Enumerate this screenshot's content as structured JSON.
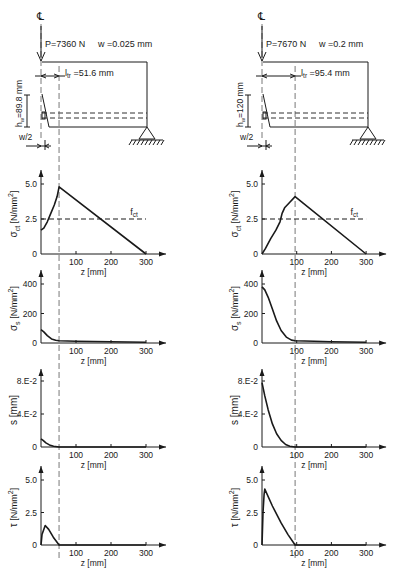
{
  "panels": [
    {
      "id": "left",
      "origin_x": 41,
      "px_per_mm": 0.35,
      "cl_symbol": "℄",
      "load_label": "P=7360 N",
      "crack_width_label": "w =0.025 mm",
      "ltr_label": "l",
      "ltr_sub": "tr",
      "ltr_value": " =51.6 mm",
      "ltr_mm": 51.6,
      "hw_label": "h",
      "hw_sub": "w",
      "hw_value": "=89.8 mm",
      "half_w_label": "w/2",
      "charts": [
        {
          "name": "sigma-ct",
          "ylabel": "σct [N/mm²]",
          "ylabel_main": "σ",
          "ylabel_sub": "ct",
          "ylabel_unit": " [N/mm",
          "ylabel_sup": "2",
          "ylabel_close": "]",
          "xlabel": "z [mm]",
          "y0": 254,
          "ytop": 170,
          "ymax_val": 5.0,
          "ymax_px": 184,
          "yticks": [
            {
              "v": 5.0,
              "label": "5.0"
            },
            {
              "v": 2.5,
              "label": "2.5"
            },
            {
              "v": 0,
              "label": "0"
            }
          ],
          "xticks": [
            100,
            200,
            300
          ],
          "fct": {
            "value": 2.5,
            "label": "f",
            "sub": "ct",
            "x_end_mm": 300
          },
          "points": [
            [
              0,
              1.7
            ],
            [
              8,
              1.85
            ],
            [
              18,
              2.3
            ],
            [
              28,
              2.9
            ],
            [
              38,
              3.5
            ],
            [
              46,
              4.1
            ],
            [
              51.6,
              4.8
            ],
            [
              300,
              0
            ]
          ]
        },
        {
          "name": "sigma-s",
          "ylabel_main": "σ",
          "ylabel_sub": "s",
          "ylabel_unit": " [N/mm",
          "ylabel_sup": "2",
          "ylabel_close": "]",
          "xlabel": "z [mm]",
          "y0": 343,
          "ytop": 270,
          "ymax_val": 400,
          "ymax_px": 284,
          "yticks": [
            {
              "v": 400,
              "label": "400"
            },
            {
              "v": 200,
              "label": "200"
            },
            {
              "v": 0,
              "label": "0"
            }
          ],
          "xticks": [
            100,
            200,
            300
          ],
          "points": [
            [
              0,
              90
            ],
            [
              8,
              75
            ],
            [
              18,
              50
            ],
            [
              30,
              28
            ],
            [
              42,
              18
            ],
            [
              51.6,
              15
            ],
            [
              100,
              12
            ],
            [
              200,
              8
            ],
            [
              300,
              5
            ]
          ]
        },
        {
          "name": "slip-s",
          "ylabel_main": "s [mm]",
          "xlabel": "z [mm]",
          "y0": 447,
          "ytop": 369,
          "ymax_val": 0.08,
          "ymax_px": 381,
          "yticks": [
            {
              "v": 0.08,
              "label": "8.E-2"
            },
            {
              "v": 0.04,
              "label": "4.E-2"
            },
            {
              "v": 0,
              "label": "0"
            }
          ],
          "xticks": [
            100,
            200,
            300
          ],
          "points": [
            [
              0,
              0.01
            ],
            [
              6,
              0.008
            ],
            [
              14,
              0.005
            ],
            [
              24,
              0.0025
            ],
            [
              36,
              0.001
            ],
            [
              51.6,
              0.0
            ],
            [
              300,
              0
            ]
          ]
        },
        {
          "name": "tau",
          "ylabel_main": "τ",
          "ylabel_unit": " [N/mm",
          "ylabel_sup": "2",
          "ylabel_close": "]",
          "xlabel": "z [mm]",
          "y0": 545,
          "ytop": 466,
          "ymax_val": 5.0,
          "ymax_px": 480,
          "yticks": [
            {
              "v": 5.0,
              "label": "5.0"
            },
            {
              "v": 2.5,
              "label": "2.5"
            },
            {
              "v": 0,
              "label": "0"
            }
          ],
          "xticks": [
            100,
            200,
            300
          ],
          "points": [
            [
              0,
              0
            ],
            [
              3,
              0.8
            ],
            [
              12,
              1.5
            ],
            [
              22,
              1.2
            ],
            [
              35,
              0.6
            ],
            [
              51.6,
              0
            ],
            [
              300,
              0
            ]
          ]
        }
      ]
    },
    {
      "id": "right",
      "origin_x": 262,
      "px_per_mm": 0.347,
      "cl_symbol": "℄",
      "load_label": "P=7670 N",
      "crack_width_label": "w =0.2 mm",
      "ltr_label": "l",
      "ltr_sub": "tr",
      "ltr_value": " =95.4 mm",
      "ltr_mm": 95.4,
      "hw_label": "h",
      "hw_sub": "w",
      "hw_value": "=120 mm",
      "half_w_label": "w/2",
      "charts": [
        {
          "name": "sigma-ct",
          "ylabel_main": "σ",
          "ylabel_sub": "ct",
          "ylabel_unit": " [N/mm",
          "ylabel_sup": "2",
          "ylabel_close": "]",
          "xlabel": "z [mm]",
          "y0": 254,
          "ytop": 170,
          "ymax_val": 5.0,
          "ymax_px": 184,
          "yticks": [
            {
              "v": 5.0,
              "label": "5.0"
            },
            {
              "v": 2.5,
              "label": "2.5"
            },
            {
              "v": 0,
              "label": "0"
            }
          ],
          "xticks": [
            100,
            200,
            300
          ],
          "fct": {
            "value": 2.5,
            "label": "f",
            "sub": "ct",
            "x_end_mm": 300
          },
          "points": [
            [
              0,
              0
            ],
            [
              10,
              0.4
            ],
            [
              25,
              1.1
            ],
            [
              40,
              1.7
            ],
            [
              52,
              2.3
            ],
            [
              58,
              2.9
            ],
            [
              65,
              3.3
            ],
            [
              80,
              3.7
            ],
            [
              95.4,
              4.1
            ],
            [
              300,
              0
            ]
          ]
        },
        {
          "name": "sigma-s",
          "ylabel_main": "σ",
          "ylabel_sub": "s",
          "ylabel_unit": " [N/mm",
          "ylabel_sup": "2",
          "ylabel_close": "]",
          "xlabel": "z [mm]",
          "y0": 343,
          "ytop": 270,
          "ymax_val": 400,
          "ymax_px": 284,
          "yticks": [
            {
              "v": 400,
              "label": "400"
            },
            {
              "v": 200,
              "label": "200"
            },
            {
              "v": 0,
              "label": "0"
            }
          ],
          "xticks": [
            100,
            200,
            300
          ],
          "points": [
            [
              0,
              380
            ],
            [
              8,
              360
            ],
            [
              18,
              310
            ],
            [
              30,
              230
            ],
            [
              42,
              150
            ],
            [
              55,
              85
            ],
            [
              70,
              40
            ],
            [
              85,
              20
            ],
            [
              95.4,
              15
            ],
            [
              150,
              12
            ],
            [
              200,
              9
            ],
            [
              300,
              5
            ]
          ]
        },
        {
          "name": "slip-s",
          "ylabel_main": "s [mm]",
          "xlabel": "z [mm]",
          "y0": 447,
          "ytop": 369,
          "ymax_val": 0.08,
          "ymax_px": 381,
          "yticks": [
            {
              "v": 0.08,
              "label": "8.E-2"
            },
            {
              "v": 0.04,
              "label": "4.E-2"
            },
            {
              "v": 0,
              "label": "0"
            }
          ],
          "xticks": [
            100,
            200,
            300
          ],
          "points": [
            [
              0,
              0.078
            ],
            [
              8,
              0.062
            ],
            [
              18,
              0.045
            ],
            [
              30,
              0.028
            ],
            [
              42,
              0.016
            ],
            [
              55,
              0.008
            ],
            [
              68,
              0.003
            ],
            [
              80,
              0.001
            ],
            [
              95.4,
              0
            ],
            [
              300,
              0
            ]
          ]
        },
        {
          "name": "tau",
          "ylabel_main": "τ",
          "ylabel_unit": " [N/mm",
          "ylabel_sup": "2",
          "ylabel_close": "]",
          "xlabel": "z [mm]",
          "y0": 545,
          "ytop": 466,
          "ymax_val": 5.0,
          "ymax_px": 480,
          "yticks": [
            {
              "v": 5.0,
              "label": "5.0"
            },
            {
              "v": 2.5,
              "label": "2.5"
            },
            {
              "v": 0,
              "label": "0"
            }
          ],
          "xticks": [
            100,
            200,
            300
          ],
          "points": [
            [
              0,
              0
            ],
            [
              3,
              2.5
            ],
            [
              6,
              3.9
            ],
            [
              8,
              4.3
            ],
            [
              30,
              3.0
            ],
            [
              55,
              1.7
            ],
            [
              75,
              0.8
            ],
            [
              95.4,
              0
            ],
            [
              300,
              0
            ]
          ]
        }
      ]
    }
  ],
  "chart_data": [
    {
      "type": "line",
      "title": "σct (w=0.025 mm)",
      "xlabel": "z [mm]",
      "ylabel": "σct [N/mm²]",
      "ylim": [
        0,
        5.0
      ],
      "xlim": [
        0,
        300
      ],
      "x": [
        0,
        8,
        18,
        28,
        38,
        46,
        51.6,
        300
      ],
      "values": [
        1.7,
        1.85,
        2.3,
        2.9,
        3.5,
        4.1,
        4.8,
        0
      ],
      "annotations": [
        "fct = 2.5"
      ]
    },
    {
      "type": "line",
      "title": "σs (w=0.025 mm)",
      "xlabel": "z [mm]",
      "ylabel": "σs [N/mm²]",
      "ylim": [
        0,
        400
      ],
      "xlim": [
        0,
        300
      ],
      "x": [
        0,
        18,
        51.6,
        100,
        200,
        300
      ],
      "values": [
        90,
        50,
        15,
        12,
        8,
        5
      ]
    },
    {
      "type": "line",
      "title": "s (w=0.025 mm)",
      "xlabel": "z [mm]",
      "ylabel": "s [mm]",
      "ylim": [
        0,
        0.08
      ],
      "xlim": [
        0,
        300
      ],
      "x": [
        0,
        14,
        36,
        51.6,
        300
      ],
      "values": [
        0.01,
        0.005,
        0.001,
        0,
        0
      ]
    },
    {
      "type": "line",
      "title": "τ (w=0.025 mm)",
      "xlabel": "z [mm]",
      "ylabel": "τ [N/mm²]",
      "ylim": [
        0,
        5.0
      ],
      "xlim": [
        0,
        300
      ],
      "x": [
        0,
        12,
        35,
        51.6,
        300
      ],
      "values": [
        0,
        1.5,
        0.6,
        0,
        0
      ]
    },
    {
      "type": "line",
      "title": "σct (w=0.2 mm)",
      "xlabel": "z [mm]",
      "ylabel": "σct [N/mm²]",
      "ylim": [
        0,
        5.0
      ],
      "xlim": [
        0,
        300
      ],
      "x": [
        0,
        25,
        52,
        65,
        95.4,
        300
      ],
      "values": [
        0,
        1.1,
        2.3,
        3.3,
        4.1,
        0
      ],
      "annotations": [
        "fct = 2.5"
      ]
    },
    {
      "type": "line",
      "title": "σs (w=0.2 mm)",
      "xlabel": "z [mm]",
      "ylabel": "σs [N/mm²]",
      "ylim": [
        0,
        400
      ],
      "xlim": [
        0,
        300
      ],
      "x": [
        0,
        18,
        42,
        70,
        95.4,
        200,
        300
      ],
      "values": [
        380,
        310,
        150,
        40,
        15,
        9,
        5
      ]
    },
    {
      "type": "line",
      "title": "s (w=0.2 mm)",
      "xlabel": "z [mm]",
      "ylabel": "s [mm]",
      "ylim": [
        0,
        0.08
      ],
      "xlim": [
        0,
        300
      ],
      "x": [
        0,
        18,
        42,
        68,
        95.4,
        300
      ],
      "values": [
        0.078,
        0.045,
        0.016,
        0.003,
        0,
        0
      ]
    },
    {
      "type": "line",
      "title": "τ (w=0.2 mm)",
      "xlabel": "z [mm]",
      "ylabel": "τ [N/mm²]",
      "ylim": [
        0,
        5.0
      ],
      "xlim": [
        0,
        300
      ],
      "x": [
        0,
        8,
        30,
        55,
        95.4,
        300
      ],
      "values": [
        0,
        4.3,
        3.0,
        1.7,
        0,
        0
      ]
    }
  ]
}
